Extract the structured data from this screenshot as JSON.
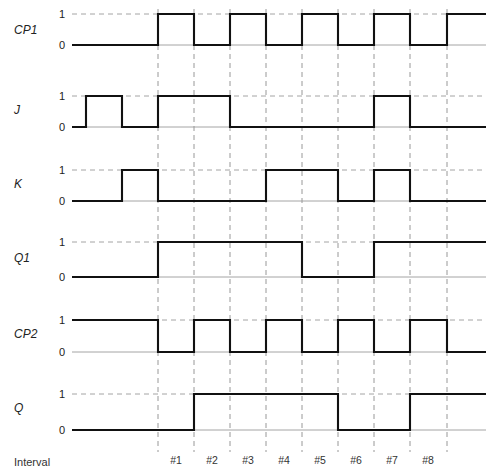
{
  "figure": {
    "type": "timing-diagram",
    "title": "",
    "interval_axis_label": "Interval",
    "level_high": "1",
    "level_low": "0",
    "geometry": {
      "width": 491,
      "height": 476,
      "wave_start_x": 72,
      "wave_end_x": 486,
      "grid_x": [
        158,
        194,
        230,
        266,
        302,
        338,
        374,
        410,
        447
      ]
    },
    "colors": {
      "wave": "#111111",
      "grid": "#8d8d8d",
      "baseline": "#9a9a9a",
      "background": "#ffffff"
    }
  },
  "intervals": [
    {
      "label": "#1",
      "x": 176
    },
    {
      "label": "#2",
      "x": 212
    },
    {
      "label": "#3",
      "x": 248
    },
    {
      "label": "#4",
      "x": 284
    },
    {
      "label": "#5",
      "x": 320
    },
    {
      "label": "#6",
      "x": 356
    },
    {
      "label": "#7",
      "x": 392
    },
    {
      "label": "#8",
      "x": 428
    }
  ],
  "signals": [
    {
      "name": "CP1",
      "label": "CP1",
      "label_x": 14,
      "label_y": 34,
      "y_high": 14,
      "y_low": 45,
      "one_label_x": 62,
      "zero_label_x": 62,
      "start_level": 0,
      "transitions": [
        158,
        194,
        230,
        266,
        302,
        338,
        374,
        410,
        447
      ],
      "waveform_points": "72,45 158,45 158,14 194,14 194,45 230,45 230,14 266,14 266,45 302,45 302,14 338,14 338,45 374,45 374,14 410,14 410,45 447,45 447,14 486,14"
    },
    {
      "name": "J",
      "label": "J",
      "label_x": 14,
      "label_y": 114,
      "y_high": 96,
      "y_low": 127,
      "one_label_x": 62,
      "zero_label_x": 62,
      "start_level": 0,
      "transitions": [
        86,
        122,
        158,
        230,
        374,
        410
      ],
      "waveform_points": "72,127 86,127 86,96 122,96 122,127 158,127 158,96 230,96 230,127 374,127 374,96 410,96 410,127 486,127"
    },
    {
      "name": "K",
      "label": "K",
      "label_x": 14,
      "label_y": 188,
      "y_high": 170,
      "y_low": 201,
      "one_label_x": 62,
      "zero_label_x": 62,
      "start_level": 0,
      "transitions": [
        122,
        158,
        266,
        338,
        374,
        410
      ],
      "waveform_points": "72,201 122,201 122,170 158,170 158,201 266,201 266,170 338,170 338,201 374,201 374,170 410,170 410,201 486,201"
    },
    {
      "name": "Q1",
      "label": "Q1",
      "label_x": 14,
      "label_y": 262,
      "y_high": 242,
      "y_low": 277,
      "one_label_x": 62,
      "zero_label_x": 62,
      "start_level": 0,
      "transitions": [
        158,
        302,
        374
      ],
      "waveform_points": "72,277 158,277 158,242 302,242 302,277 374,277 374,242 486,242"
    },
    {
      "name": "CP2",
      "label": "CP2",
      "label_x": 14,
      "label_y": 338,
      "y_high": 320,
      "y_low": 352,
      "one_label_x": 62,
      "zero_label_x": 62,
      "start_level": 1,
      "transitions": [
        158,
        194,
        230,
        266,
        302,
        338,
        374,
        410,
        447
      ],
      "waveform_points": "72,320 158,320 158,352 194,352 194,320 230,320 230,352 266,352 266,320 302,320 302,352 338,352 338,320 374,320 374,352 410,352 410,320 447,320 447,352 486,352"
    },
    {
      "name": "Q",
      "label": "Q",
      "label_x": 14,
      "label_y": 412,
      "y_high": 394,
      "y_low": 430,
      "one_label_x": 62,
      "zero_label_x": 62,
      "start_level": 0,
      "transitions": [
        194,
        338,
        410
      ],
      "waveform_points": "72,430 194,430 194,394 338,394 338,430 410,430 410,394 486,394"
    }
  ]
}
